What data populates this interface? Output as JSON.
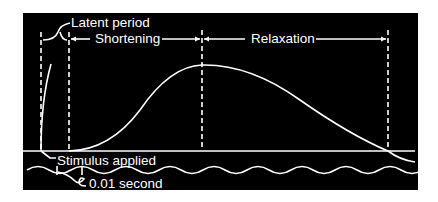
{
  "diagram": {
    "labels": {
      "latent_period": "Latent period",
      "shortening": "Shortening",
      "relaxation": "Relaxation",
      "stimulus_applied": "Stimulus applied",
      "time_marker": "0.01 second"
    },
    "colors": {
      "background": "#000000",
      "foreground": "#ffffff"
    },
    "phases": [
      {
        "name": "Latent period",
        "start_x": 41,
        "end_x": 69
      },
      {
        "name": "Shortening",
        "start_x": 69,
        "end_x": 202
      },
      {
        "name": "Relaxation",
        "start_x": 202,
        "end_x": 388
      }
    ]
  }
}
